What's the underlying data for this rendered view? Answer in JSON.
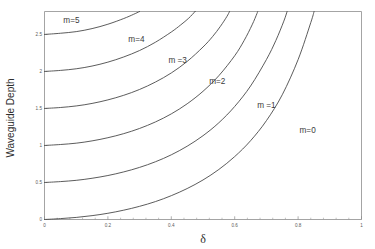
{
  "chart_data": {
    "type": "line",
    "title": "",
    "xlabel": "δ",
    "ylabel": "Waveguide Depth",
    "xlim": [
      0,
      1
    ],
    "ylim": [
      0,
      2.81
    ],
    "grid": false,
    "legend_position": "inline-annotations",
    "xticks": [
      0,
      0.2,
      0.4,
      0.6,
      0.8,
      1
    ],
    "xticklabels": [
      "0",
      "0.2",
      "0.4",
      "0.6",
      "0.8",
      "1"
    ],
    "yticks": [
      0,
      0.5,
      1,
      1.5,
      2,
      2.5
    ],
    "yticklabels": [
      "0",
      "0.5",
      "1",
      "1.5",
      "2",
      "2.5"
    ],
    "x_minor_tick_count": 4,
    "annotations": [
      {
        "text": "m=5",
        "x": 0.085,
        "y": 2.66
      },
      {
        "text": "m=4",
        "x": 0.29,
        "y": 2.4
      },
      {
        "text": "m =3",
        "x": 0.42,
        "y": 2.11
      },
      {
        "text": "m=2",
        "x": 0.545,
        "y": 1.83
      },
      {
        "text": "m =1",
        "x": 0.7,
        "y": 1.5
      },
      {
        "text": "m=0",
        "x": 0.83,
        "y": 1.17
      }
    ],
    "series": [
      {
        "name": "m=0",
        "intercept": 0.0,
        "x": [
          0,
          0.05,
          0.1,
          0.15,
          0.2,
          0.25,
          0.3,
          0.35,
          0.4,
          0.45,
          0.5,
          0.55,
          0.6,
          0.65,
          0.7,
          0.75,
          0.8,
          0.84,
          0.86,
          0.88,
          0.89,
          0.895
        ],
        "y": [
          0,
          0.012,
          0.028,
          0.052,
          0.084,
          0.126,
          0.178,
          0.242,
          0.322,
          0.418,
          0.534,
          0.676,
          0.85,
          1.064,
          1.335,
          1.685,
          2.16,
          2.66,
          2.95,
          3.3,
          3.55,
          3.7
        ]
      },
      {
        "name": "m=1",
        "intercept": 0.5,
        "x": [
          0,
          0.05,
          0.1,
          0.15,
          0.2,
          0.25,
          0.3,
          0.35,
          0.4,
          0.45,
          0.5,
          0.55,
          0.6,
          0.65,
          0.7,
          0.73,
          0.755,
          0.77,
          0.78
        ],
        "y": [
          0.5,
          0.512,
          0.529,
          0.557,
          0.594,
          0.643,
          0.704,
          0.78,
          0.874,
          0.99,
          1.132,
          1.307,
          1.527,
          1.803,
          2.16,
          2.42,
          2.68,
          2.87,
          3.0
        ]
      },
      {
        "name": "m=2",
        "intercept": 1.0,
        "x": [
          0,
          0.05,
          0.1,
          0.15,
          0.2,
          0.25,
          0.3,
          0.35,
          0.4,
          0.45,
          0.5,
          0.55,
          0.6,
          0.63,
          0.655,
          0.67,
          0.68
        ],
        "y": [
          1.0,
          1.013,
          1.031,
          1.062,
          1.105,
          1.16,
          1.23,
          1.318,
          1.427,
          1.563,
          1.732,
          1.943,
          2.212,
          2.42,
          2.63,
          2.78,
          2.9
        ]
      },
      {
        "name": "m=3",
        "intercept": 1.5,
        "x": [
          0,
          0.05,
          0.1,
          0.15,
          0.2,
          0.25,
          0.3,
          0.35,
          0.4,
          0.45,
          0.5,
          0.53,
          0.555,
          0.575,
          0.59
        ],
        "y": [
          1.5,
          1.513,
          1.534,
          1.568,
          1.616,
          1.678,
          1.757,
          1.857,
          1.98,
          2.135,
          2.33,
          2.47,
          2.61,
          2.74,
          2.86
        ]
      },
      {
        "name": "m=4",
        "intercept": 2.0,
        "x": [
          0,
          0.05,
          0.1,
          0.15,
          0.2,
          0.25,
          0.3,
          0.35,
          0.4,
          0.43,
          0.455,
          0.475,
          0.49,
          0.5
        ],
        "y": [
          2.0,
          2.014,
          2.036,
          2.073,
          2.126,
          2.196,
          2.283,
          2.395,
          2.533,
          2.63,
          2.72,
          2.81,
          2.88,
          2.95
        ]
      },
      {
        "name": "m=5",
        "intercept": 2.5,
        "x": [
          0,
          0.05,
          0.1,
          0.15,
          0.2,
          0.25,
          0.28,
          0.3,
          0.32,
          0.34,
          0.355
        ],
        "y": [
          2.5,
          2.516,
          2.538,
          2.579,
          2.638,
          2.715,
          2.77,
          2.81,
          2.86,
          2.91,
          2.96
        ]
      }
    ]
  }
}
